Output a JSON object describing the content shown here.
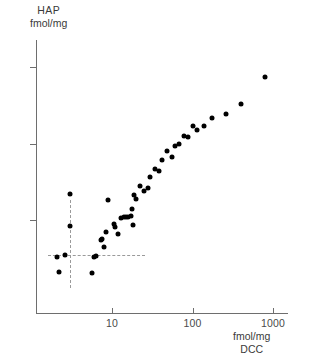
{
  "chart_data": {
    "type": "scatter",
    "title": "",
    "ylabel_lines": [
      "HAP",
      "fmol/mg"
    ],
    "xlabel_lines": [
      "fmol/mg",
      "DCC"
    ],
    "xscale": "log",
    "yscale": "log",
    "xlim": [
      1.6,
      2000
    ],
    "ylim": [
      1.3,
      2000
    ],
    "xticks": [
      10,
      100,
      1000
    ],
    "xtick_labels": [
      "10",
      "100",
      "1000"
    ],
    "yticks": [
      10,
      100,
      1000
    ],
    "ytick_labels": [
      "10",
      "100",
      "1000"
    ],
    "grid": false,
    "legend": null,
    "annotations": [
      {
        "name": "vertical-cutoff",
        "type": "vline",
        "x": 3.0,
        "style": "dashed",
        "y_from": 1.3,
        "y_to": 18
      },
      {
        "name": "horizontal-cutoff",
        "type": "hline",
        "y": 3.5,
        "style": "dashed",
        "x_from": 1.6,
        "x_to": 26
      }
    ],
    "point_color": "#000000",
    "axis_color": "#6e6e6e",
    "guide_color": "#9a9a9a",
    "n_points": 45,
    "x": [
      2.1,
      2.6,
      2.2,
      3.0,
      3.0,
      5.6,
      6.0,
      6.3,
      7.4,
      7.6,
      8.0,
      8.5,
      9.0,
      10.5,
      11.0,
      12.0,
      13.0,
      14.0,
      15.0,
      16.0,
      17.0,
      17.5,
      18.0,
      19.0,
      20.0,
      22.0,
      25.0,
      28.0,
      30.0,
      34.0,
      38.0,
      42.0,
      48.0,
      55.0,
      60.0,
      68.0,
      78.0,
      88.0,
      100.0,
      115.0,
      140.0,
      175.0,
      260.0,
      400.0,
      800.0
    ],
    "y": [
      3.3,
      3.5,
      2.1,
      8.3,
      22.0,
      2.0,
      3.3,
      3.4,
      5.5,
      5.6,
      4.4,
      6.9,
      18.0,
      9.0,
      8.1,
      6.6,
      10.5,
      11.0,
      11.0,
      11.0,
      11.2,
      14.0,
      8.6,
      21.0,
      19.0,
      28.0,
      24.0,
      26.0,
      37.0,
      46.0,
      44.0,
      61.0,
      80.0,
      66.0,
      94.0,
      100.0,
      125.0,
      123.0,
      170.0,
      152.0,
      168.0,
      215.0,
      240.0,
      330.0,
      740.0
    ]
  },
  "axis": {
    "y_title_1": "HAP",
    "y_title_2": "fmol/mg",
    "x_title_1": "fmol/mg",
    "x_title_2": "DCC",
    "ytick_1000": "1000",
    "ytick_100": "100",
    "ytick_10": "10",
    "xtick_10": "10",
    "xtick_100": "100",
    "xtick_1000": "1000"
  }
}
